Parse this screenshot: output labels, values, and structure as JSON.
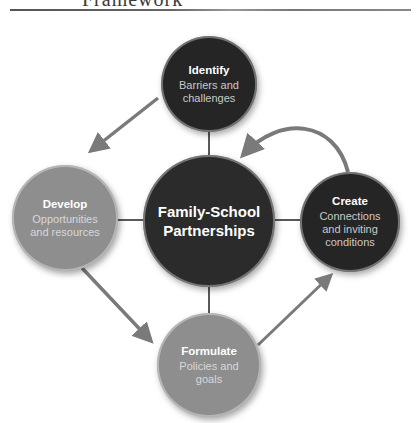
{
  "header": {
    "title_fragment": "Framework"
  },
  "diagram": {
    "center": {
      "label": "Family-School Partnerships",
      "line1": "Family-School",
      "line2": "Partnerships",
      "color": "#2b2b2b"
    },
    "nodes": [
      {
        "id": "identify",
        "title": "Identify",
        "line1": "Barriers and",
        "line2": "challenges",
        "color": "#252525"
      },
      {
        "id": "develop",
        "title": "Develop",
        "line1": "Opportunities",
        "line2": "and resources",
        "color": "#8e8e8e"
      },
      {
        "id": "create",
        "title": "Create",
        "line1": "Connections",
        "line2": "and inviting",
        "line3": "conditions",
        "color": "#252525"
      },
      {
        "id": "formulate",
        "title": "Formulate",
        "line1": "Policies and",
        "line2": "goals",
        "color": "#8e8e8e"
      }
    ],
    "arrows": [
      {
        "from": "identify",
        "to": "develop"
      },
      {
        "from": "develop",
        "to": "formulate"
      },
      {
        "from": "formulate",
        "to": "create"
      },
      {
        "from": "create",
        "to": "center"
      }
    ],
    "arrow_color": "#7a7a7a",
    "connector_color": "#222222"
  }
}
